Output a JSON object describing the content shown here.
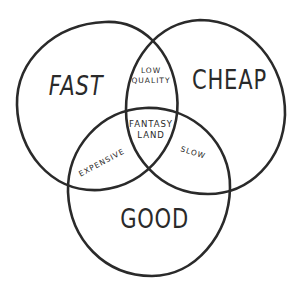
{
  "diagram": {
    "type": "venn",
    "stroke_color": "#2a2a2a",
    "background_color": "#ffffff",
    "sets": [
      {
        "id": "fast",
        "label": "FAST"
      },
      {
        "id": "cheap",
        "label": "CHEAP"
      },
      {
        "id": "good",
        "label": "GOOD"
      }
    ],
    "intersections": {
      "fast_cheap": {
        "line1": "LOW",
        "line2": "QUALITY"
      },
      "fast_good": {
        "label": "EXPENSIVE"
      },
      "cheap_good": {
        "label": "SLOW"
      },
      "all_three": {
        "line1": "FANTASY",
        "line2": "LAND"
      }
    }
  }
}
